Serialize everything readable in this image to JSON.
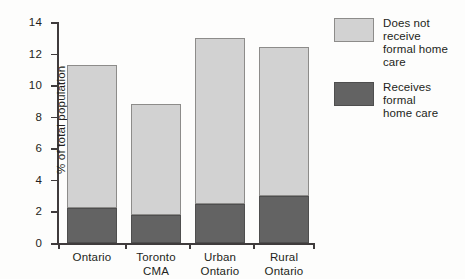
{
  "chart_data": {
    "type": "bar",
    "stacked": true,
    "title": "",
    "xlabel": "",
    "ylabel": "% of total population",
    "ylim": [
      0,
      14
    ],
    "ytick_step": 2,
    "yticks": [
      "14",
      "12",
      "10",
      "8",
      "6",
      "4",
      "2",
      "0"
    ],
    "ytick_values": [
      14,
      12,
      10,
      8,
      6,
      4,
      2,
      0
    ],
    "grid": false,
    "categories": [
      "Ontario",
      "Toronto\nCMA",
      "Urban\nOntario",
      "Rural\nOntario"
    ],
    "series": [
      {
        "name": "Receives formal home care",
        "color": "#636363",
        "values": [
          2.2,
          1.75,
          2.5,
          3.0
        ]
      },
      {
        "name": "Does not receive formal home care",
        "color": "#d2d2d2",
        "values": [
          9.1,
          7.05,
          10.5,
          9.4
        ]
      }
    ],
    "totals": [
      11.3,
      8.8,
      13.0,
      12.4
    ],
    "legend_position": "right",
    "legend": [
      {
        "label": "Does not receive\nformal home care",
        "color": "#d2d2d2",
        "swatch": "light-gray-swatch"
      },
      {
        "label": "Receives formal\nhome care",
        "color": "#636363",
        "swatch": "dark-gray-swatch"
      }
    ]
  },
  "colors": {
    "light_fill": "#d2d2d2",
    "dark_fill": "#636363",
    "axis": "#3f3b3c",
    "text": "#231f20",
    "background": "#fdfdfc"
  }
}
